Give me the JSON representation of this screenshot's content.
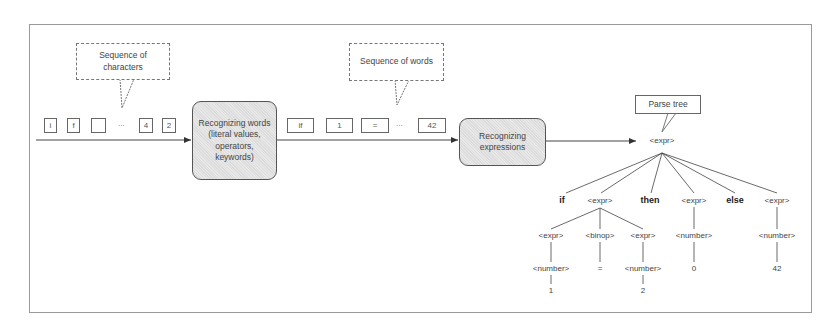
{
  "callouts": {
    "characters": "Sequence of\ncharacters",
    "words": "Sequence of words",
    "parse_tree": "Parse tree"
  },
  "character_tokens": [
    "i",
    "f",
    "",
    "...",
    "4",
    "2"
  ],
  "word_tokens": [
    "if",
    "1",
    "=",
    "...",
    "42"
  ],
  "stages": {
    "recognize_words": "Recognizing words\n(literal values,\noperators,\nkeywords)",
    "recognize_expressions": "Recognizing\nexpressions"
  },
  "tree": {
    "root": "<expr>",
    "level1": [
      "if",
      "<expr>",
      "then",
      "<expr>",
      "else",
      "<expr>"
    ],
    "level2": [
      "<expr>",
      "<binop>",
      "<expr>",
      "<number>",
      "<number>"
    ],
    "level3": [
      "<number>",
      "=",
      "<number>",
      "0",
      "42"
    ],
    "level4": [
      "1",
      "2"
    ]
  },
  "colors": {
    "border": "#9a9a9a",
    "stage_fill": "#e2e2e2",
    "line": "#444444"
  }
}
